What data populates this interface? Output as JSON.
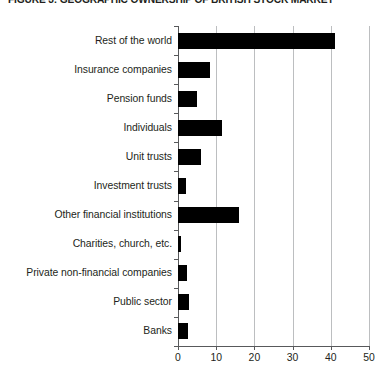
{
  "figure": {
    "title": "FIGURE 3: GEOGRAPHIC OWNERSHIP OF BRITISH STOCK MARKET"
  },
  "chart_data": {
    "type": "bar",
    "orientation": "horizontal",
    "title": "FIGURE 3: GEOGRAPHIC OWNERSHIP OF BRITISH STOCK MARKET",
    "xlabel": "",
    "ylabel": "",
    "xlim": [
      0,
      50
    ],
    "xticks": [
      0,
      10,
      20,
      30,
      40,
      50
    ],
    "xtick_labels": [
      "0",
      "10",
      "20",
      "30",
      "40",
      "50"
    ],
    "grid": "vertical",
    "legend": "none",
    "bar_color": "#000000",
    "categories": [
      "Rest of the world",
      "Insurance companies",
      "Pension funds",
      "Individuals",
      "Unit trusts",
      "Investment trusts",
      "Other financial institutions",
      "Charities, church, etc.",
      "Private non-financial companies",
      "Public sector",
      "Banks"
    ],
    "values": [
      41,
      8.5,
      5,
      11.5,
      6,
      2,
      16,
      0.7,
      2.3,
      3,
      2.5
    ]
  }
}
